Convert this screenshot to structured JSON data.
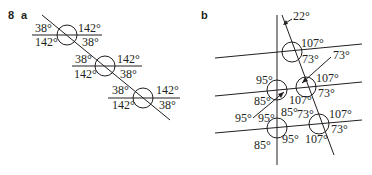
{
  "question_number": "8",
  "part_a": {
    "label": "a",
    "intersections": [
      {
        "top_left": "38°",
        "top_right": "142°",
        "bottom_left": "142°",
        "bottom_right": "38°"
      },
      {
        "top_left": "38°",
        "top_right": "142°",
        "bottom_left": "142°",
        "bottom_right": "38°"
      },
      {
        "top_left": "38°",
        "top_right": "142°",
        "bottom_left": "142°",
        "bottom_right": "38°"
      }
    ]
  },
  "part_b": {
    "label": "b",
    "top_angle": "22°",
    "top_right_intersection": {
      "top_right": "107°",
      "bottom_right": "73°"
    },
    "arrow_label_right": "73°",
    "middle_left_intersection": {
      "top_left": "95°",
      "bottom_left": "85°"
    },
    "middle_right_intersection": {
      "top_right": "107°",
      "bottom_right": "73°",
      "bottom_left": "107°"
    },
    "arrow_label_left": "95°",
    "bottom_left_intersection": {
      "top_left": "95°",
      "top_right": "85°",
      "bottom_left": "85°",
      "bottom_right": "95°"
    },
    "bottom_right_intersection": {
      "top_left": "73°",
      "top_right": "107°",
      "bottom_right": "73°",
      "bottom_left": "107°"
    }
  }
}
